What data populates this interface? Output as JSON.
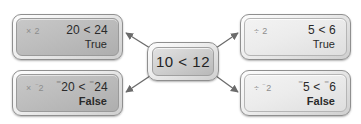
{
  "diagram": {
    "type": "inequality-operations-flow",
    "center": {
      "expression": "10 < 12"
    },
    "branches": [
      {
        "id": "top-left",
        "operation": "× 2",
        "expression": "20 < 24",
        "result": "True",
        "result_bold": false,
        "tone": "dark"
      },
      {
        "id": "bottom-left",
        "operation": "× ‑2",
        "operation_prefix": "×",
        "operation_operand_negative": true,
        "operation_operand": "2",
        "expression_left_negative": true,
        "expression_left": "20",
        "expression_right_negative": true,
        "expression_right": "24",
        "comparator": "<",
        "result": "False",
        "result_bold": true,
        "tone": "dark"
      },
      {
        "id": "top-right",
        "operation": "÷ 2",
        "expression": "5 < 6",
        "result": "True",
        "result_bold": false,
        "tone": "light"
      },
      {
        "id": "bottom-right",
        "operation": "÷ ‑2",
        "operation_prefix": "÷",
        "operation_operand_negative": true,
        "operation_operand": "2",
        "expression_left_negative": true,
        "expression_left": "5",
        "expression_right_negative": true,
        "expression_right": "6",
        "comparator": "<",
        "result": "False",
        "result_bold": true,
        "tone": "light"
      }
    ],
    "negative_sign": "⁻",
    "colors": {
      "arrow": "#6b6b6b",
      "text": "#2a2a2a",
      "operator_text": "#8d8d8d",
      "background": "#ffffff"
    }
  }
}
